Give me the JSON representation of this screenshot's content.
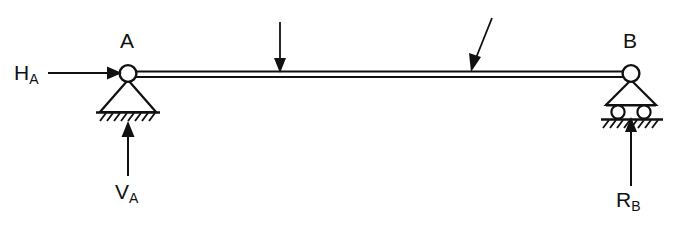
{
  "figure": {
    "type": "free-body-diagram",
    "stroke_color": "#111111",
    "background_color": "#ffffff"
  },
  "beam": {
    "label": "beam",
    "x_start": 128,
    "x_end": 631,
    "y_top": 72,
    "y_bottom": 77
  },
  "nodes": [
    {
      "name": "A",
      "label": "A",
      "x": 128,
      "y": 73,
      "support": "pin"
    },
    {
      "name": "B",
      "label": "B",
      "x": 631,
      "y": 73,
      "support": "roller"
    }
  ],
  "supports": {
    "left": {
      "type": "pin",
      "name": "pin-support-A",
      "ground_hatch_marks": 8
    },
    "right": {
      "type": "roller",
      "name": "roller-support-B",
      "roller_count": 2,
      "ground_hatch_marks": 9
    }
  },
  "loads": [
    {
      "name": "point-load-1",
      "orientation": "vertical",
      "direction": "down",
      "tip_x": 280,
      "tip_y": 72,
      "tail_x": 280,
      "tail_y": 22,
      "label": ""
    },
    {
      "name": "point-load-2",
      "orientation": "inclined",
      "direction": "down-left",
      "tip_x": 471,
      "tip_y": 71,
      "tail_x": 492,
      "tail_y": 18,
      "label": ""
    }
  ],
  "reactions": [
    {
      "name": "horizontal-reaction-A",
      "symbol": "H",
      "subscript": "A",
      "direction": "right",
      "tip_x": 122,
      "tip_y": 73,
      "tail_x": 50,
      "tail_y": 73,
      "label_x": 14,
      "label_y": 62
    },
    {
      "name": "vertical-reaction-A",
      "symbol": "V",
      "subscript": "A",
      "direction": "up",
      "tip_x": 128,
      "tip_y": 122,
      "tail_x": 128,
      "tail_y": 176,
      "label_x": 115,
      "label_y": 181
    },
    {
      "name": "vertical-reaction-B",
      "symbol": "R",
      "subscript": "B",
      "direction": "up",
      "tip_x": 631,
      "tip_y": 118,
      "tail_x": 631,
      "tail_y": 186,
      "label_x": 616,
      "label_y": 189
    }
  ],
  "labels": {
    "node_a": "A",
    "node_b": "B",
    "ha_symbol": "H",
    "ha_sub": "A",
    "va_symbol": "V",
    "va_sub": "A",
    "rb_symbol": "R",
    "rb_sub": "B"
  }
}
